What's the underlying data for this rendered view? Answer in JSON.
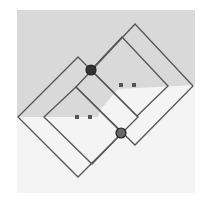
{
  "diagram": {
    "canvas": {
      "width": 208,
      "height": 201,
      "background": "#ffffff"
    },
    "panel": {
      "x": 17,
      "y": 10,
      "width": 178,
      "height": 183,
      "fill": "#f4f4f4"
    },
    "shaded_region": {
      "fill": "#d9d9d9",
      "points": [
        [
          17,
          10
        ],
        [
          195,
          10
        ],
        [
          195,
          85
        ],
        [
          118,
          89
        ],
        [
          100,
          110
        ],
        [
          98,
          117
        ],
        [
          17,
          117
        ]
      ]
    },
    "line_color": "#555555",
    "shapes": [
      {
        "name": "left-outer-rectangle",
        "points": [
          [
            78,
            57
          ],
          [
            138,
            117
          ],
          [
            78,
            177
          ],
          [
            18,
            117
          ]
        ]
      },
      {
        "name": "left-inner-rectangle",
        "points": [
          [
            76,
            87
          ],
          [
            122,
            133
          ],
          [
            92,
            164
          ],
          [
            44,
            117
          ]
        ]
      },
      {
        "name": "right-outer-rectangle",
        "points": [
          [
            135,
            24
          ],
          [
            193,
            86
          ],
          [
            135,
            145
          ],
          [
            76,
            87
          ]
        ]
      },
      {
        "name": "right-inner-rectangle",
        "points": [
          [
            122,
            37
          ],
          [
            168,
            86
          ],
          [
            137,
            116
          ],
          [
            91,
            70
          ]
        ]
      }
    ],
    "joints": [
      {
        "name": "joint-upper",
        "cx": 91,
        "cy": 70,
        "r": 5,
        "fill": "#333333"
      },
      {
        "name": "joint-lower",
        "cx": 121,
        "cy": 133,
        "r": 5,
        "fill": "#666666"
      }
    ],
    "markers": [
      {
        "name": "marker-left-1",
        "x": 77,
        "y": 117
      },
      {
        "name": "marker-left-2",
        "x": 90,
        "y": 117
      },
      {
        "name": "marker-right-1",
        "x": 121,
        "y": 85
      },
      {
        "name": "marker-right-2",
        "x": 134,
        "y": 85
      }
    ],
    "marker_color": "#555555"
  }
}
